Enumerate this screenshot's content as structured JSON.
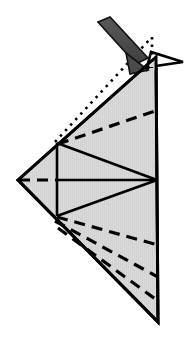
{
  "figure": {
    "kind": "origami-fold-diagram",
    "title": "",
    "caption": "",
    "canvas": {
      "width": 192,
      "height": 338,
      "background": "#ffffff"
    },
    "colors": {
      "paper_fill": "#d9d9d9",
      "paper_fill_highlight": "#e3e3e3",
      "outline": "#000000",
      "crease_dashed": "#000000",
      "crease_dotted": "#000000",
      "arrow_fill": "#4a4a4a",
      "arrow_outline": "#111111",
      "white": "#ffffff"
    },
    "stroke_widths": {
      "outline": 3.0,
      "inner_solid": 2.6,
      "dashed": 3.2,
      "dotted": 2.6,
      "arrow_outline": 1.6
    },
    "dash_patterns": {
      "valley_dash": "11 7",
      "hidden_dotted": "2.5 5"
    },
    "shapes": {
      "main_body": {
        "name": "folded-paper-body",
        "points": "18,180 156,57 158,322"
      },
      "top_spike": {
        "name": "top-right-spike-flap",
        "points": "146,70 152,53 182,62 150,66"
      },
      "inner_vertical_crease": {
        "x": 57,
        "y1": 143,
        "y2": 216
      },
      "inner_horizontal_crease": {
        "x1": 18,
        "y1": 180,
        "x2": 158,
        "y2": 180
      },
      "inner_horizontal_dash_end_x": 57,
      "inner_triangle_upper": "57,143 157,180",
      "inner_triangle_lower": "57,216 157,180",
      "upper_dashed_crease": {
        "x1": 58,
        "y1": 144,
        "x2": 158,
        "y2": 110
      },
      "lower_dashed_creases": [
        {
          "x1": 57,
          "y1": 217,
          "x2": 158,
          "y2": 245
        },
        {
          "x1": 55,
          "y1": 221,
          "x2": 158,
          "y2": 277
        },
        {
          "x1": 58,
          "y1": 228,
          "x2": 158,
          "y2": 301
        }
      ],
      "dotted_creases": [
        {
          "x1": 55,
          "y1": 142,
          "x2": 151,
          "y2": 38
        },
        {
          "x1": 152,
          "y1": 37,
          "x2": 152,
          "y2": 68
        }
      ],
      "fold_arrow": {
        "shaft": "98,22 110,17 148,58 136,64",
        "head": "126,53 148,70 130,74",
        "direction": "down-right",
        "label": "fold-arrow"
      }
    }
  }
}
